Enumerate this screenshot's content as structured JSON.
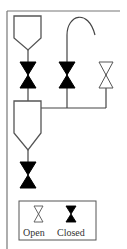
{
  "diagram": {
    "colors": {
      "stroke": "#555555",
      "valve_closed_fill": "#000000",
      "valve_open_fill": "#ffffff",
      "background": "#ffffff"
    },
    "valves": [
      {
        "id": "valve-1",
        "state": "closed"
      },
      {
        "id": "valve-2",
        "state": "closed"
      },
      {
        "id": "valve-3",
        "state": "open"
      },
      {
        "id": "valve-4",
        "state": "closed"
      }
    ],
    "legend": {
      "open_label": "Open",
      "closed_label": "Closed"
    }
  }
}
